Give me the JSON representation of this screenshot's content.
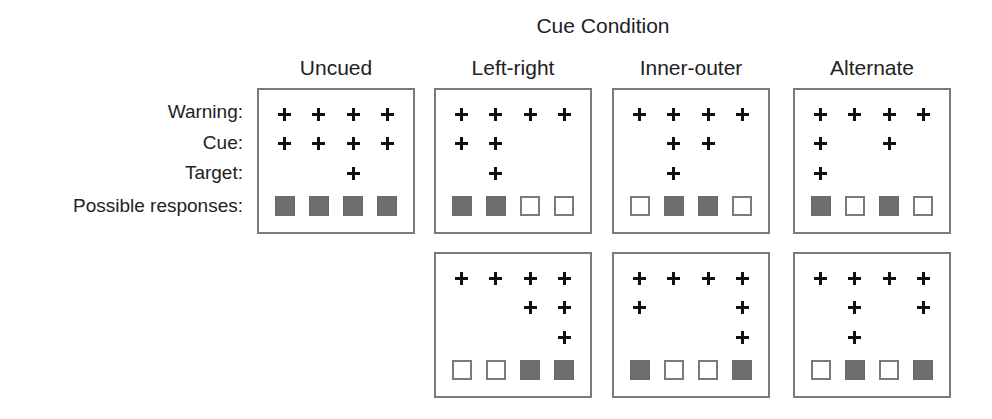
{
  "title": "Cue Condition",
  "row_labels": [
    "Warning:",
    "Cue:",
    "Target:",
    "Possible responses:"
  ],
  "columns": [
    {
      "name": "Uncued"
    },
    {
      "name": "Left-right"
    },
    {
      "name": "Inner-outer"
    },
    {
      "name": "Alternate"
    }
  ],
  "panels": [
    {
      "condition": "Uncued",
      "row": 1,
      "warning": [
        1,
        1,
        1,
        1
      ],
      "cue": [
        1,
        1,
        1,
        1
      ],
      "target": [
        0,
        0,
        1,
        0
      ],
      "responses": [
        "filled",
        "filled",
        "filled",
        "filled"
      ]
    },
    {
      "condition": "Left-right",
      "row": 1,
      "warning": [
        1,
        1,
        1,
        1
      ],
      "cue": [
        1,
        1,
        0,
        0
      ],
      "target": [
        0,
        1,
        0,
        0
      ],
      "responses": [
        "filled",
        "filled",
        "empty",
        "empty"
      ]
    },
    {
      "condition": "Inner-outer",
      "row": 1,
      "warning": [
        1,
        1,
        1,
        1
      ],
      "cue": [
        0,
        1,
        1,
        0
      ],
      "target": [
        0,
        1,
        0,
        0
      ],
      "responses": [
        "empty",
        "filled",
        "filled",
        "empty"
      ]
    },
    {
      "condition": "Alternate",
      "row": 1,
      "warning": [
        1,
        1,
        1,
        1
      ],
      "cue": [
        1,
        0,
        1,
        0
      ],
      "target": [
        1,
        0,
        0,
        0
      ],
      "responses": [
        "filled",
        "empty",
        "filled",
        "empty"
      ]
    },
    {
      "condition": "Left-right",
      "row": 2,
      "warning": [
        1,
        1,
        1,
        1
      ],
      "cue": [
        0,
        0,
        1,
        1
      ],
      "target": [
        0,
        0,
        0,
        1
      ],
      "responses": [
        "empty",
        "empty",
        "filled",
        "filled"
      ]
    },
    {
      "condition": "Inner-outer",
      "row": 2,
      "warning": [
        1,
        1,
        1,
        1
      ],
      "cue": [
        1,
        0,
        0,
        1
      ],
      "target": [
        0,
        0,
        0,
        1
      ],
      "responses": [
        "filled",
        "empty",
        "empty",
        "filled"
      ]
    },
    {
      "condition": "Alternate",
      "row": 2,
      "warning": [
        1,
        1,
        1,
        1
      ],
      "cue": [
        0,
        1,
        0,
        1
      ],
      "target": [
        0,
        1,
        0,
        0
      ],
      "responses": [
        "empty",
        "filled",
        "empty",
        "filled"
      ]
    }
  ],
  "colors": {
    "filled": "#6e6e6e",
    "border": "#7a7a7a",
    "plus": "#111111"
  }
}
